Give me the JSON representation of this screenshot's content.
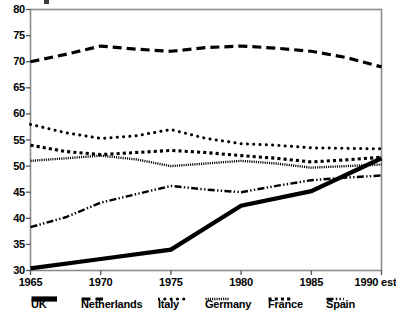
{
  "chart_data": {
    "type": "line",
    "title": "",
    "subtitle": "",
    "xlabel": "",
    "ylabel": "",
    "x": [
      "1965",
      "1970",
      "1975",
      "1980",
      "1985",
      "1990 est"
    ],
    "xtick_labels": [
      "1965",
      "1970",
      "1975",
      "1980",
      "1985",
      "1990 est"
    ],
    "ytick_labels": [
      "30",
      "35",
      "40",
      "45",
      "50",
      "55",
      "60",
      "65",
      "70",
      "75",
      "80"
    ],
    "ylim": [
      30,
      80
    ],
    "ytick_step": 5,
    "grid": false,
    "frame": true,
    "legend_position": "below-axis",
    "series": [
      {
        "name": "UK",
        "style": "thick-solid",
        "values": [
          30.4,
          32.2,
          34.0,
          42.4,
          45.2,
          51.5
        ]
      },
      {
        "name": "Netherlands",
        "style": "long-dashed",
        "values": [
          70.0,
          73.0,
          72.0,
          73.0,
          72.0,
          69.0
        ]
      },
      {
        "name": "Italy",
        "style": "round-dotted",
        "values": [
          58.0,
          55.3,
          57.0,
          54.3,
          53.5,
          53.3
        ]
      },
      {
        "name": "Germany",
        "style": "fine-dotted",
        "values": [
          51.0,
          52.0,
          50.0,
          51.0,
          49.7,
          50.3
        ]
      },
      {
        "name": "France",
        "style": "square-dotted",
        "values": [
          54.0,
          52.2,
          53.0,
          52.0,
          50.8,
          51.7
        ]
      },
      {
        "name": "Spain",
        "style": "dash-dot",
        "values": [
          38.3,
          43.0,
          46.2,
          45.0,
          47.3,
          48.2
        ]
      }
    ],
    "series_waypoints": {
      "UK": [
        [
          1965,
          30.4
        ],
        [
          1970,
          32.2
        ],
        [
          1975,
          34.0
        ],
        [
          1980,
          42.4
        ],
        [
          1985,
          45.2
        ],
        [
          1990,
          51.5
        ]
      ],
      "Netherlands": [
        [
          1965,
          70.0
        ],
        [
          1967.5,
          71.4
        ],
        [
          1970,
          73.0
        ],
        [
          1972.5,
          72.4
        ],
        [
          1975,
          72.0
        ],
        [
          1977.5,
          72.7
        ],
        [
          1980,
          73.0
        ],
        [
          1982.5,
          72.6
        ],
        [
          1985,
          72.0
        ],
        [
          1987.5,
          70.8
        ],
        [
          1990,
          69.0
        ]
      ],
      "Italy": [
        [
          1965,
          58.0
        ],
        [
          1967.5,
          56.4
        ],
        [
          1970,
          55.3
        ],
        [
          1972.5,
          55.8
        ],
        [
          1975,
          57.0
        ],
        [
          1977.5,
          55.3
        ],
        [
          1980,
          54.3
        ],
        [
          1982.5,
          54.0
        ],
        [
          1985,
          53.5
        ],
        [
          1987.5,
          53.4
        ],
        [
          1990,
          53.3
        ]
      ],
      "Germany": [
        [
          1965,
          51.0
        ],
        [
          1967.5,
          51.5
        ],
        [
          1970,
          52.0
        ],
        [
          1972.5,
          51.3
        ],
        [
          1975,
          50.0
        ],
        [
          1977.5,
          50.5
        ],
        [
          1980,
          51.0
        ],
        [
          1982.5,
          50.5
        ],
        [
          1985,
          49.7
        ],
        [
          1987.5,
          50.0
        ],
        [
          1990,
          50.3
        ]
      ],
      "France": [
        [
          1965,
          54.0
        ],
        [
          1967.5,
          52.8
        ],
        [
          1970,
          52.2
        ],
        [
          1972.5,
          52.6
        ],
        [
          1975,
          53.0
        ],
        [
          1977.5,
          52.6
        ],
        [
          1980,
          52.0
        ],
        [
          1982.5,
          51.5
        ],
        [
          1985,
          50.8
        ],
        [
          1987.5,
          51.2
        ],
        [
          1990,
          51.7
        ]
      ],
      "Spain": [
        [
          1965,
          38.3
        ],
        [
          1967.5,
          40.2
        ],
        [
          1970,
          43.0
        ],
        [
          1972.5,
          44.6
        ],
        [
          1975,
          46.2
        ],
        [
          1977.5,
          45.5
        ],
        [
          1980,
          45.0
        ],
        [
          1982.5,
          46.2
        ],
        [
          1985,
          47.3
        ],
        [
          1987.5,
          47.8
        ],
        [
          1990,
          48.2
        ]
      ]
    }
  },
  "axes": {
    "y_labels": [
      "80",
      "75",
      "70",
      "65",
      "60",
      "55",
      "50",
      "45",
      "40",
      "35",
      "30"
    ],
    "x_labels": [
      "1965",
      "1970",
      "1975",
      "1980",
      "1985",
      "1990 est"
    ]
  },
  "legend": {
    "items": [
      {
        "label": "UK",
        "swatch": "thick-solid-swatch"
      },
      {
        "label": "Netherlands",
        "swatch": "long-dashed-swatch"
      },
      {
        "label": "Italy",
        "swatch": "round-dotted-swatch"
      },
      {
        "label": "Germany",
        "swatch": "fine-dotted-swatch"
      },
      {
        "label": "France",
        "swatch": "square-dotted-swatch"
      },
      {
        "label": "Spain",
        "swatch": "dash-dot-swatch"
      }
    ]
  },
  "colors": {
    "ink": "#000000",
    "frame": "#8c8c8c",
    "background": "#ffffff"
  }
}
